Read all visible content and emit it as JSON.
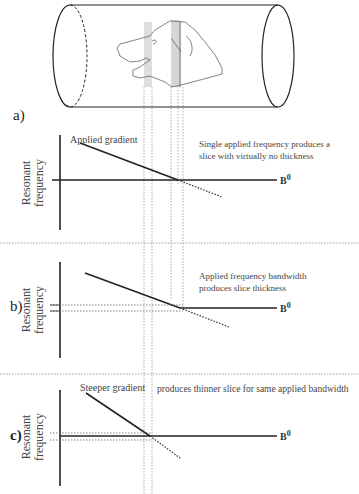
{
  "figure": {
    "top": {
      "description": "Cylinder (MRI bore) with dog head profile; slice bands shown as gray vertical strips"
    },
    "sections": [
      {
        "label": "a)",
        "gradient_label": "Applied gradient",
        "note_line1": "Single applied frequency produces a",
        "note_line2": "slice with virtually no thickness",
        "y_axis_line1": "Resonant",
        "y_axis_line2": "frequency",
        "field_label": "B",
        "field_sup": "0"
      },
      {
        "label": "b)",
        "note_line1": "Applied frequency bandwidth",
        "note_line2": "produces slice thickness",
        "y_axis_line1": "Resonant",
        "y_axis_line2": "frequency",
        "field_label": "B",
        "field_sup": "0"
      },
      {
        "label": "c)",
        "gradient_label": "Steeper gradient",
        "note_line1": "produces thinner slice for same applied bandwidth",
        "y_axis_line1": "Resonant",
        "y_axis_line2": "frequency",
        "field_label": "B",
        "field_sup": "0"
      }
    ],
    "colors": {
      "line": "#222222",
      "band": "#d9d9d9",
      "dotted": "#777777"
    }
  }
}
